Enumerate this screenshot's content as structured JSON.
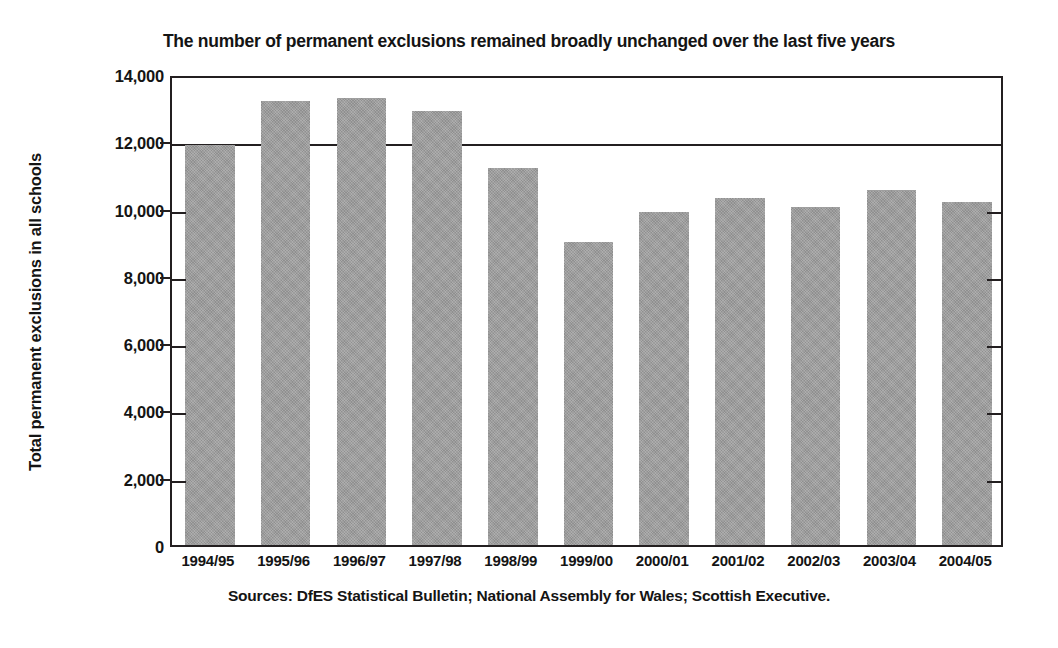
{
  "chart_data": {
    "type": "bar",
    "title": "The number of permanent exclusions remained broadly unchanged over the last five years",
    "xlabel": "",
    "ylabel": "Total permanent exclusions in all schools",
    "categories": [
      "1994/95",
      "1995/96",
      "1996/97",
      "1997/98",
      "1998/99",
      "1999/00",
      "2000/01",
      "2001/02",
      "2002/03",
      "2003/04",
      "2004/05"
    ],
    "values": [
      11900,
      13200,
      13300,
      12900,
      11200,
      9000,
      9900,
      10300,
      10050,
      10550,
      10200
    ],
    "series": [
      {
        "name": "Total permanent exclusions in all schools",
        "values": [
          11900,
          13200,
          13300,
          12900,
          11200,
          9000,
          9900,
          10300,
          10050,
          10550,
          10200
        ]
      }
    ],
    "ylim": [
      0,
      14000
    ],
    "ytick_values": [
      0,
      2000,
      4000,
      6000,
      8000,
      10000,
      12000,
      14000
    ],
    "ytick_labels": [
      "0",
      "2,000",
      "4,000",
      "6,000",
      "8,000",
      "10,000",
      "12,000",
      "14,000"
    ],
    "grid": "horizontal",
    "legend": "none",
    "bar_color": "#9b9b9b",
    "axis_color": "#231f20",
    "source_note": "Sources: DfES Statistical Bulletin; National Assembly for Wales; Scottish Executive."
  }
}
